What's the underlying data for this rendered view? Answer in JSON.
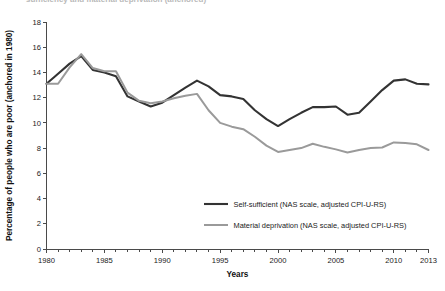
{
  "chart_data": {
    "type": "line",
    "title": "",
    "xlabel": "Years",
    "ylabel": "Percentage of people who are poor (anchored in 1980)",
    "xlim": [
      1980,
      2013
    ],
    "ylim": [
      0,
      18
    ],
    "ytick_step": 2,
    "grid": false,
    "legend_position": "inside-lower-right",
    "xticks": [
      "1980",
      "1985",
      "1990",
      "1995",
      "2000",
      "2005",
      "2010",
      "2013"
    ],
    "xtick_values": [
      1980,
      1985,
      1990,
      1995,
      2000,
      2005,
      2010,
      2013
    ],
    "yticks": [
      "0",
      "2",
      "4",
      "6",
      "8",
      "10",
      "12",
      "14",
      "16",
      "18"
    ],
    "ytick_values": [
      0,
      2,
      4,
      6,
      8,
      10,
      12,
      14,
      16,
      18
    ],
    "x": [
      1980,
      1981,
      1982,
      1983,
      1984,
      1985,
      1986,
      1987,
      1988,
      1989,
      1990,
      1991,
      1992,
      1993,
      1994,
      1995,
      1996,
      1997,
      1998,
      1999,
      2000,
      2001,
      2002,
      2003,
      2004,
      2005,
      2006,
      2007,
      2008,
      2009,
      2010,
      2011,
      2012,
      2013
    ],
    "series": [
      {
        "name": "Self-sufficient (NAS scale, adjusted CPI-U-RS)",
        "color": "#333333",
        "linewidth": 2.1,
        "values": [
          13.1,
          13.9,
          14.7,
          15.3,
          14.2,
          14.0,
          13.7,
          12.1,
          11.7,
          11.3,
          11.6,
          12.2,
          12.8,
          13.35,
          12.9,
          12.2,
          12.1,
          11.9,
          11.0,
          10.3,
          9.75,
          10.3,
          10.8,
          11.25,
          11.25,
          11.3,
          10.65,
          10.8,
          11.7,
          12.6,
          13.35,
          13.45,
          13.1,
          13.05
        ]
      },
      {
        "name": "Material deprivation (NAS scale, adjusted CPI-U-RS)",
        "color": "#9a9a9a",
        "linewidth": 2.0,
        "values": [
          13.1,
          13.1,
          14.4,
          15.45,
          14.35,
          14.1,
          14.1,
          12.4,
          11.75,
          11.55,
          11.7,
          11.95,
          12.15,
          12.3,
          11.0,
          10.0,
          9.7,
          9.5,
          8.9,
          8.2,
          7.7,
          7.85,
          8.0,
          8.35,
          8.1,
          7.9,
          7.65,
          7.85,
          8.0,
          8.05,
          8.45,
          8.4,
          8.3,
          7.85
        ]
      }
    ],
    "legend": [
      {
        "label": "Self-sufficient (NAS scale, adjusted CPI-U-RS)",
        "color": "#333333"
      },
      {
        "label": "Material deprivation (NAS scale, adjusted CPI-U-RS)",
        "color": "#9a9a9a"
      }
    ]
  },
  "colors": {
    "self_sufficient": "#333333",
    "material_deprivation": "#9a9a9a",
    "axis": "#4a4a4a",
    "text": "#1a1a1a",
    "background": "#ffffff"
  },
  "cropped_header": {
    "text": "sufficiency and material deprivation (anchored)"
  }
}
